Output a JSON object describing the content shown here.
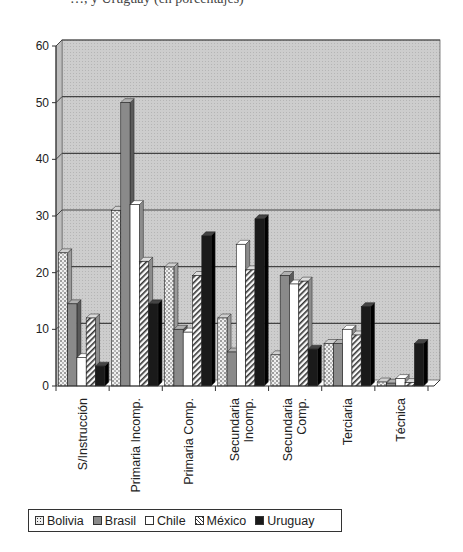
{
  "header": {
    "caption_fragment": "…, y Uruguay (en porcentajes)"
  },
  "chart_data": {
    "type": "bar",
    "style": "3d-clustered-column",
    "title": "",
    "xlabel": "",
    "ylabel": "",
    "ylim": [
      0,
      60
    ],
    "yticks": [
      0,
      10,
      20,
      30,
      40,
      50,
      60
    ],
    "grid": true,
    "legend_position": "bottom",
    "categories": [
      "S/Instrucción",
      "Primaria Incomp.",
      "Primaria Comp.",
      "Secundaria Incomp.",
      "Secundaria Comp.",
      "Terciaria",
      "Técnica"
    ],
    "series": [
      {
        "name": "Bolivia",
        "pattern": "dotted",
        "values": [
          23.5,
          31,
          21,
          12,
          5.5,
          7.5,
          0.7
        ]
      },
      {
        "name": "Brasil",
        "pattern": "gray",
        "values": [
          14.5,
          50,
          10,
          6,
          19.5,
          7.5,
          0.5
        ]
      },
      {
        "name": "Chile",
        "pattern": "white",
        "values": [
          5,
          32,
          9.5,
          25,
          18,
          10,
          1.3
        ]
      },
      {
        "name": "México",
        "pattern": "hatched",
        "values": [
          12,
          22,
          19.5,
          20.5,
          18.5,
          9,
          0.6
        ]
      },
      {
        "name": "Uruguay",
        "pattern": "black",
        "values": [
          3.5,
          14.5,
          26.5,
          29.5,
          6.5,
          14,
          7.5
        ]
      }
    ]
  },
  "legend": {
    "items": [
      {
        "label": "Bolivia",
        "pattern": "dotted"
      },
      {
        "label": "Brasil",
        "pattern": "gray"
      },
      {
        "label": "Chile",
        "pattern": "white"
      },
      {
        "label": "México",
        "pattern": "hatched"
      },
      {
        "label": "Uruguay",
        "pattern": "black"
      }
    ]
  },
  "colors": {
    "wall": "#c9c9c9",
    "grid": "#444444",
    "dotted": "#e8e8e8",
    "gray": "#8a8a8a",
    "white": "#ffffff",
    "hatched": "#f4f4f4",
    "black": "#1a1a1a"
  }
}
